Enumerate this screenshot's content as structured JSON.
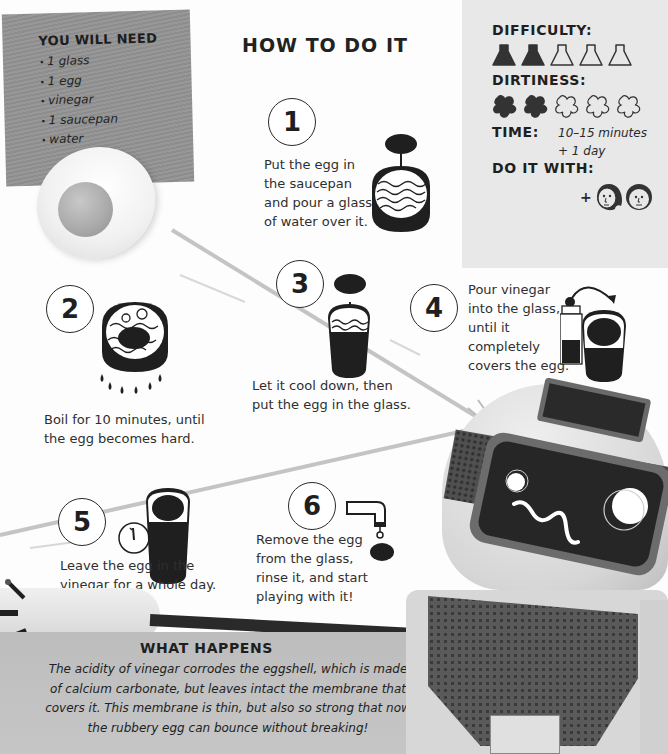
{
  "you_will_need": {
    "title": "YOU WILL NEED",
    "items": [
      "1 glass",
      "1 egg",
      "vinegar",
      "1 saucepan",
      "water"
    ]
  },
  "how_to": {
    "title": "HOW TO DO IT",
    "steps": [
      {
        "number": "1",
        "text": "Put the egg in the saucepan and pour a glass of water over it.",
        "lines": [
          "Put the egg in",
          "the saucepan",
          "and pour a glass",
          "of water over it."
        ],
        "icon": "saucepan-water-egg-icon"
      },
      {
        "number": "2",
        "text": "Boil for 10 minutes, until the egg becomes hard.",
        "lines": [
          "Boil for 10 minutes, until",
          "the egg becomes hard."
        ],
        "icon": "boiling-pot-flames-icon"
      },
      {
        "number": "3",
        "text": "Let it cool down, then put the egg in the glass.",
        "lines": [
          "Let it cool down, then",
          "put the egg in the glass."
        ],
        "icon": "egg-into-glass-icon"
      },
      {
        "number": "4",
        "text": "Pour vinegar into the glass, until it completely covers the egg.",
        "lines": [
          "Pour vinegar",
          "into the glass,",
          "until it",
          "completely",
          "covers the egg."
        ],
        "icon": "vinegar-bottle-pour-icon"
      },
      {
        "number": "5",
        "text": "Leave the egg in the vinegar for a whole day.",
        "lines": [
          "Leave the egg in the",
          "vinegar for a whole day."
        ],
        "icon": "clock-glass-icon"
      },
      {
        "number": "6",
        "text": "Remove the egg from the glass, rinse it, and start playing with it!",
        "lines": [
          "Remove the egg",
          "from the glass,",
          "rinse it, and start",
          "playing with it!"
        ],
        "icon": "tap-rinse-egg-icon"
      }
    ]
  },
  "info": {
    "difficulty_label": "DIFFICULTY:",
    "difficulty": {
      "filled": 2,
      "total": 5
    },
    "dirtiness_label": "DIRTINESS:",
    "dirtiness": {
      "filled": 2,
      "total": 5
    },
    "time_label": "TIME:",
    "time_lines": [
      "10–15 minutes",
      "+ 1 day"
    ],
    "do_it_with_label": "DO IT WITH:",
    "do_it_with_plus": "+",
    "companions": [
      "girl-face-icon",
      "boy-face-icon"
    ]
  },
  "what_happens": {
    "title": "WHAT HAPPENS",
    "lines": [
      "The acidity of vinegar corrodes the eggshell, which is made",
      "of calcium carbonate, but leaves intact the membrane that",
      "covers it. This membrane is thin, but also so strong that now",
      "the rubbery egg can bounce without breaking!"
    ]
  },
  "colors": {
    "panel_dark": "#8d8d8d",
    "panel_light": "#e8e8e8",
    "ink": "#1f1f1f",
    "what_bg": "#c2c2c2"
  }
}
